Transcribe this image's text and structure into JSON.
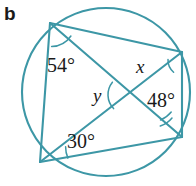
{
  "figure": {
    "part_label": "b",
    "shape": "cyclic-quadrilateral-with-diagonals",
    "stroke_color": "#3d97a6",
    "text_color": "#1a1a1a",
    "background_color": "#ffffff"
  },
  "circle": {
    "cx": 106,
    "cy": 92,
    "r": 84
  },
  "vertices": [
    {
      "id": "A",
      "name": "top-left-vertex",
      "x": 50,
      "y": 23
    },
    {
      "id": "B",
      "name": "top-right-vertex",
      "x": 182,
      "y": 52
    },
    {
      "id": "C",
      "name": "bottom-right-vertex",
      "x": 182,
      "y": 137
    },
    {
      "id": "D",
      "name": "bottom-left-vertex",
      "x": 40,
      "y": 162
    }
  ],
  "edges": [
    {
      "name": "edge-AB",
      "from": "A",
      "to": "B"
    },
    {
      "name": "edge-BC",
      "from": "B",
      "to": "C"
    },
    {
      "name": "edge-CD",
      "from": "C",
      "to": "D"
    },
    {
      "name": "edge-DA",
      "from": "D",
      "to": "A"
    }
  ],
  "diagonals": [
    {
      "name": "diagonal-AC",
      "from": "A",
      "to": "C"
    },
    {
      "name": "diagonal-BD",
      "from": "B",
      "to": "D"
    }
  ],
  "intersection": {
    "name": "diagonal-intersection",
    "x": 128,
    "y": 95
  },
  "angles": [
    {
      "id": "a54",
      "label": "54°",
      "value": 54,
      "unit": "degrees",
      "at_vertex": "A",
      "known": true
    },
    {
      "id": "ax",
      "label": "x",
      "value": null,
      "unit": "degrees",
      "at_vertex": "B",
      "known": false
    },
    {
      "id": "ay",
      "label": "y",
      "value": null,
      "unit": "degrees",
      "at_vertex": "intersection",
      "known": false
    },
    {
      "id": "a48",
      "label": "48°",
      "value": 48,
      "unit": "degrees",
      "at_vertex": "C",
      "known": true
    },
    {
      "id": "a30",
      "label": "30°",
      "value": 30,
      "unit": "degrees",
      "at_vertex": "D",
      "known": true
    }
  ]
}
